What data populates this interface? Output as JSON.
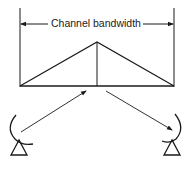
{
  "diagram": {
    "bandwidth_label": "Channel bandwidth",
    "stroke_color": "#1a1a1a",
    "elements": {
      "bandwidth_dimension": "double-headed arrow spanning channel bandwidth",
      "spectrum_shape": "triangle with center vertical line",
      "uplink_arrow": "arrow from left earth station to spectrum peak",
      "downlink_arrow": "arrow from spectrum peak to right earth station",
      "left_station": "dish-antenna-icon",
      "right_station": "dish-antenna-icon"
    }
  }
}
